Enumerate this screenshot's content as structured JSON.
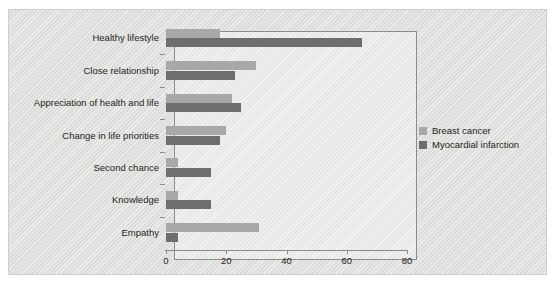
{
  "chart_data": {
    "type": "bar",
    "orientation": "horizontal",
    "title": "",
    "subtitle": "",
    "xlabel": "",
    "ylabel": "",
    "xlim": [
      0,
      80
    ],
    "xticks": [
      0,
      20,
      40,
      60,
      80
    ],
    "xticklabels": [
      "0",
      "20",
      "40",
      "60",
      "80"
    ],
    "grid": false,
    "legend_position": "right",
    "categories": [
      "Healthy lifestyle",
      "Close relationship",
      "Appreciation of health and life",
      "Change in life priorities",
      "Second chance",
      "Knowledge",
      "Empathy"
    ],
    "series": [
      {
        "name": "Breast cancer",
        "color": "#a8a8a6",
        "values": [
          18,
          30,
          22,
          20,
          4,
          4,
          31
        ]
      },
      {
        "name": "Myocardial infarction",
        "color": "#6e6e6c",
        "values": [
          65,
          23,
          25,
          18,
          15,
          15,
          4
        ]
      }
    ]
  },
  "legend": {
    "items": [
      {
        "label": "Breast cancer",
        "color": "#a8a8a6"
      },
      {
        "label": "Myocardial infarction",
        "color": "#6e6e6c"
      }
    ]
  },
  "colors": {
    "panel_background": "#dcdcda",
    "plot_background": "#e7e7e5",
    "axis": "#8c8c8c",
    "text": "#231f20",
    "series_breast_cancer": "#a8a8a6",
    "series_myocardial_infarction": "#6e6e6c"
  }
}
